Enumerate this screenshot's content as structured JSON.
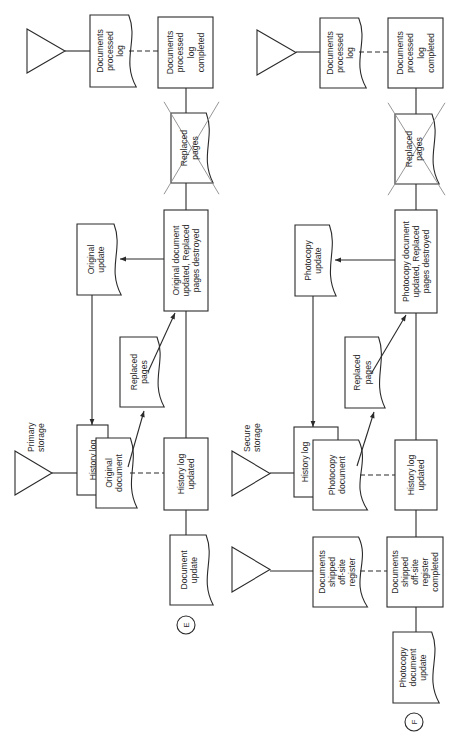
{
  "panels": [
    {
      "id": "E",
      "connector_label": "E",
      "storage_top": {
        "label": ""
      },
      "documents_processed_log": {
        "lines": [
          "Documents",
          "processed",
          "log"
        ]
      },
      "documents_processed_log_completed": {
        "lines": [
          "Documents",
          "processed",
          "log",
          "completed"
        ]
      },
      "replaced_pages_destroyed_doc": {
        "lines": [
          "Replaced",
          "pages"
        ]
      },
      "update_output_doc": {
        "lines": [
          "Original",
          "update"
        ]
      },
      "document_updated_process": {
        "lines": [
          "Original document",
          "updated, Replaced",
          "pages destroyed"
        ]
      },
      "replaced_pages_doc": {
        "lines": [
          "Replaced",
          "pages"
        ]
      },
      "storage_main": {
        "label_lines": [
          "Primary",
          "storage"
        ]
      },
      "history_log": {
        "lines": [
          "History log"
        ]
      },
      "working_document": {
        "lines": [
          "Original",
          "document"
        ]
      },
      "history_log_updated": {
        "lines": [
          "History log",
          "updated"
        ]
      },
      "input_update_doc": {
        "lines": [
          "Document",
          "update"
        ]
      }
    },
    {
      "id": "F",
      "connector_label": "F",
      "storage_top": {
        "label": ""
      },
      "documents_processed_log": {
        "lines": [
          "Documents",
          "processed",
          "log"
        ]
      },
      "documents_processed_log_completed": {
        "lines": [
          "Documents",
          "processed",
          "log",
          "completed"
        ]
      },
      "replaced_pages_destroyed_doc": {
        "lines": [
          "Replaced",
          "pages"
        ]
      },
      "update_output_doc": {
        "lines": [
          "Photocopy",
          "update"
        ]
      },
      "document_updated_process": {
        "lines": [
          "Photocopy document",
          "updated, Replaced",
          "pages destroyed"
        ]
      },
      "replaced_pages_doc": {
        "lines": [
          "Replaced",
          "pages"
        ]
      },
      "storage_main": {
        "label_lines": [
          "Secure",
          "storage"
        ]
      },
      "history_log": {
        "lines": [
          "History log"
        ]
      },
      "working_document": {
        "lines": [
          "Photocopy",
          "document"
        ]
      },
      "history_log_updated": {
        "lines": [
          "History log",
          "updated"
        ]
      },
      "shipped_storage": {
        "label": ""
      },
      "shipped_register": {
        "lines": [
          "Documents",
          "shipped",
          "off-site",
          "register"
        ]
      },
      "shipped_register_completed": {
        "lines": [
          "Documents",
          "shipped",
          "off-site",
          "register",
          "completed"
        ]
      },
      "input_update_doc": {
        "lines": [
          "Photocopy",
          "document",
          "update"
        ]
      }
    }
  ]
}
